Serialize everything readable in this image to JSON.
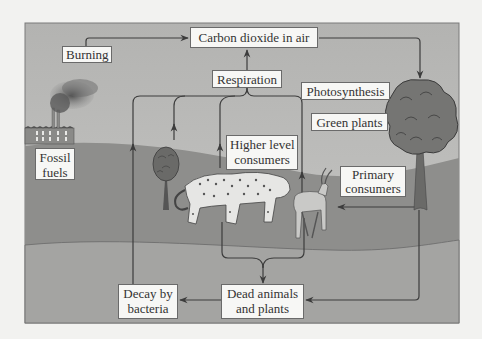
{
  "diagram": {
    "nodes": {
      "co2": {
        "text": "Carbon dioxide in air"
      },
      "burning": {
        "text": "Burning"
      },
      "respiration": {
        "text": "Respiration"
      },
      "photosynthesis": {
        "text": "Photosynthesis"
      },
      "green_plants": {
        "text": "Green plants"
      },
      "higher_consumers": {
        "line1": "Higher level",
        "line2": "consumers"
      },
      "primary_consumers": {
        "line1": "Primary",
        "line2": "consumers"
      },
      "fossil_fuels": {
        "line1": "Fossil",
        "line2": "fuels"
      },
      "decay": {
        "line1": "Decay by",
        "line2": "bacteria"
      },
      "dead": {
        "line1": "Dead animals",
        "line2": "and plants"
      }
    },
    "edges": [
      {
        "from": "Burning",
        "to": "Carbon dioxide in air"
      },
      {
        "from": "Respiration",
        "to": "Carbon dioxide in air"
      },
      {
        "from": "Carbon dioxide in air",
        "to": "Green plants",
        "label": "Photosynthesis"
      },
      {
        "from": "Decay by bacteria",
        "to": "Respiration"
      },
      {
        "from": "Green plants",
        "to": "Respiration"
      },
      {
        "from": "Higher level consumers",
        "to": "Respiration"
      },
      {
        "from": "Primary consumers",
        "to": "Respiration"
      },
      {
        "from": "Green plants",
        "to": "Primary consumers"
      },
      {
        "from": "Higher level consumers",
        "to": "Dead animals and plants"
      },
      {
        "from": "Primary consumers",
        "to": "Dead animals and plants"
      },
      {
        "from": "Green plants",
        "to": "Dead animals and plants"
      },
      {
        "from": "Dead animals and plants",
        "to": "Decay by bacteria"
      }
    ],
    "icons": [
      "factory-icon",
      "smoke-icon",
      "small-tree-icon",
      "large-tree-icon",
      "leopard-icon",
      "antelope-icon"
    ]
  },
  "colors": {
    "page_bg": "#f2f2f0",
    "sky": "#b9b9b7",
    "hill": "#8e8e8c",
    "ground": "#a3a3a1",
    "arrow": "#3c3c3c",
    "label_bg": "#f7f7f5"
  }
}
